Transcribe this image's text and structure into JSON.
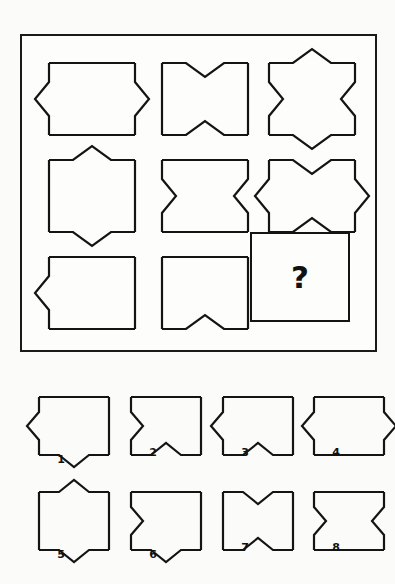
{
  "puzzle": {
    "title": "Figure Matrix Reasoning Puzzle",
    "question_mark": "?",
    "matrix": {
      "rows": 3,
      "cols": 3,
      "cells": [
        {
          "id": "cell-r1c1",
          "position": "row1-col1",
          "shape": "rectangle",
          "top": "none",
          "right": "outward-triangle",
          "bottom": "none",
          "left": "outward-triangle",
          "description": "rectangle with outward triangles on left and right"
        },
        {
          "id": "cell-r1c2",
          "position": "row1-col2",
          "shape": "rectangle",
          "top": "inward-notch",
          "right": "none",
          "bottom": "inward-notch",
          "left": "none",
          "description": "rectangle with inward notches on top and bottom"
        },
        {
          "id": "cell-r1c3",
          "position": "row1-col3",
          "shape": "rectangle",
          "top": "outward-triangle",
          "right": "inward-notch",
          "bottom": "outward-triangle",
          "left": "inward-notch",
          "description": "rectangle with outward triangles top and bottom, inward notches left and right"
        },
        {
          "id": "cell-r2c1",
          "position": "row2-col1",
          "shape": "rectangle",
          "top": "outward-triangle",
          "right": "none",
          "bottom": "outward-triangle",
          "left": "none",
          "description": "rectangle with outward triangles on top and bottom"
        },
        {
          "id": "cell-r2c2",
          "position": "row2-col2",
          "shape": "rectangle",
          "top": "none",
          "right": "inward-notch",
          "bottom": "none",
          "left": "inward-notch",
          "description": "rectangle with inward notches on left and right"
        },
        {
          "id": "cell-r2c3",
          "position": "row2-col3",
          "shape": "rectangle",
          "top": "inward-notch",
          "right": "outward-triangle",
          "bottom": "inward-notch",
          "left": "outward-triangle",
          "description": "rectangle with inward notches top and bottom, outward triangles left and right"
        },
        {
          "id": "cell-r3c1",
          "position": "row3-col1",
          "shape": "rectangle",
          "top": "none",
          "right": "none",
          "bottom": "none",
          "left": "outward-triangle",
          "description": "rectangle with outward triangle on left"
        },
        {
          "id": "cell-r3c2",
          "position": "row3-col2",
          "shape": "rectangle",
          "top": "none",
          "right": "none",
          "bottom": "inward-notch",
          "left": "none",
          "description": "rectangle with inward notch on bottom"
        },
        {
          "id": "cell-r3c3",
          "position": "row3-col3",
          "shape": "question-box",
          "top": "none",
          "right": "none",
          "bottom": "none",
          "left": "none",
          "description": "empty box containing a question mark"
        }
      ]
    },
    "options": [
      {
        "id": "option-1",
        "label": "1",
        "top": "none",
        "right": "none",
        "bottom": "outward-triangle",
        "left": "outward-triangle",
        "description": "rectangle with outward triangle on left and outward triangle on bottom"
      },
      {
        "id": "option-2",
        "label": "2",
        "top": "none",
        "right": "none",
        "bottom": "inward-notch",
        "left": "inward-notch",
        "description": "rectangle with inward notch on left and inward notch on bottom"
      },
      {
        "id": "option-3",
        "label": "3",
        "top": "none",
        "right": "none",
        "bottom": "inward-notch",
        "left": "outward-triangle",
        "description": "rectangle with outward triangle on left and inward notch on bottom"
      },
      {
        "id": "option-4",
        "label": "4",
        "top": "none",
        "right": "outward-triangle",
        "bottom": "none",
        "left": "outward-triangle",
        "description": "rectangle with outward triangles on left and right"
      },
      {
        "id": "option-5",
        "label": "5",
        "top": "outward-triangle",
        "right": "none",
        "bottom": "outward-triangle",
        "left": "none",
        "description": "rectangle with outward triangles on top and bottom"
      },
      {
        "id": "option-6",
        "label": "6",
        "top": "none",
        "right": "none",
        "bottom": "outward-triangle",
        "left": "inward-notch",
        "description": "rectangle with inward notch on left and outward triangle on bottom"
      },
      {
        "id": "option-7",
        "label": "7",
        "top": "inward-notch",
        "right": "none",
        "bottom": "inward-notch",
        "left": "none",
        "description": "rectangle with inward notches on top and bottom"
      },
      {
        "id": "option-8",
        "label": "8",
        "top": "none",
        "right": "inward-notch",
        "bottom": "none",
        "left": "inward-notch",
        "description": "rectangle with inward notches on left and right"
      }
    ],
    "colors": {
      "stroke": "#141414",
      "background": "#fbfbf9",
      "panel": "#fdfdfb"
    }
  }
}
